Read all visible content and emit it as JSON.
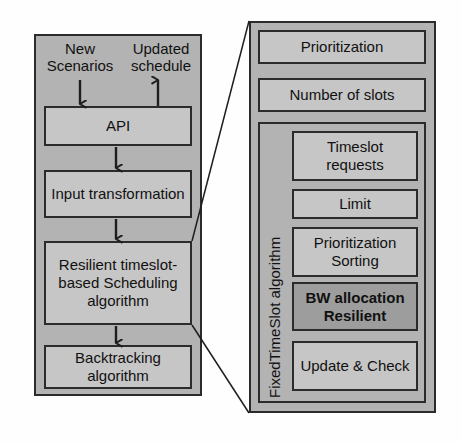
{
  "diagram": {
    "colors": {
      "panel_fill": "#b3b3b3",
      "box_fill": "#c6c6c6",
      "highlight_fill": "#9d9d9d",
      "stroke": "#2b2b2b",
      "text": "#111111",
      "page_background": "#fefefe"
    }
  },
  "left_panel": {
    "inputs": [
      {
        "label": "New\nScenarios",
        "arrow": "down"
      },
      {
        "label": "Updated\nschedule",
        "arrow": "up"
      }
    ],
    "nodes": [
      {
        "id": "api",
        "label": "API"
      },
      {
        "id": "input-transformation",
        "label": "Input\ntransformation"
      },
      {
        "id": "resilient-scheduling",
        "label": "Resilient  timeslot-\nbased Scheduling\nalgorithm"
      },
      {
        "id": "backtracking",
        "label": "Backtracking\nalgorithm"
      }
    ],
    "flow_arrows": [
      {
        "from": "api",
        "to": "input-transformation",
        "direction": "down"
      },
      {
        "from": "input-transformation",
        "to": "resilient-scheduling",
        "direction": "down"
      },
      {
        "from": "resilient-scheduling",
        "to": "backtracking",
        "direction": "down"
      }
    ]
  },
  "right_panel": {
    "nodes": [
      {
        "id": "prioritization",
        "label": "Prioritization",
        "highlighted": false
      },
      {
        "id": "number-of-slots",
        "label": "Number of slots",
        "highlighted": false
      }
    ],
    "inner_group": {
      "vertical_label": "FixedTimeSlot  algorithm",
      "nodes": [
        {
          "id": "timeslot-requests",
          "label": "Timeslot\nrequests",
          "highlighted": false
        },
        {
          "id": "limit",
          "label": "Limit",
          "highlighted": false
        },
        {
          "id": "prioritization-sorting",
          "label": "Prioritization\nSorting",
          "highlighted": false
        },
        {
          "id": "bw-allocation-resilient",
          "label": "BW allocation\nResilient",
          "highlighted": true
        },
        {
          "id": "update-and-check",
          "label": "Update\n& Check",
          "highlighted": false
        }
      ]
    }
  },
  "connectors": {
    "description": "Two diagonal expansion lines from the Resilient timeslot-based Scheduling algorithm box to the detail panel",
    "lines": [
      {
        "from": "resilient-scheduling-top-right",
        "to": "right-panel-top-left"
      },
      {
        "from": "resilient-scheduling-bottom-right",
        "to": "right-panel-bottom-left"
      }
    ]
  }
}
